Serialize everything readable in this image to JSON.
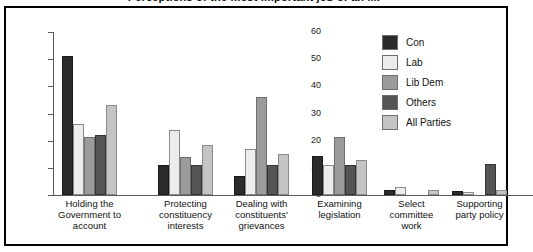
{
  "title": "Perceptions of the most important job of an MP",
  "legend": {
    "position": "top-right",
    "entries": [
      {
        "label": "Con",
        "color": "#2b2b2b",
        "icon": "legend-swatch"
      },
      {
        "label": "Lab",
        "color": "#ececec",
        "icon": "legend-swatch"
      },
      {
        "label": "Lib Dem",
        "color": "#9b9b9b",
        "icon": "legend-swatch"
      },
      {
        "label": "Others",
        "color": "#555555",
        "icon": "legend-swatch"
      },
      {
        "label": "All Parties",
        "color": "#c4c4c4",
        "icon": "legend-swatch"
      }
    ]
  },
  "axis": {
    "y_ticks": [
      "0",
      "10",
      "20",
      "30",
      "40",
      "50",
      "60"
    ],
    "y_min": 0,
    "y_max": 60
  },
  "chart_data": {
    "type": "bar",
    "title": "Perceptions of the most important job of an MP",
    "xlabel": "",
    "ylabel": "",
    "ylim": [
      0,
      60
    ],
    "grid": false,
    "legend_position": "top-right",
    "categories": [
      "Holding the Government to account",
      "Protecting constituency interests",
      "Dealing with constituents' grievances",
      "Examining legislation",
      "Select committee work",
      "Supporting party policy"
    ],
    "category_lines": [
      [
        "Holding the",
        "Government to",
        "account"
      ],
      [
        "Protecting",
        "constituency",
        "interests"
      ],
      [
        "Dealing with",
        "constituents'",
        "grievances"
      ],
      [
        "Examining",
        "legislation"
      ],
      [
        "Select",
        "committee",
        "work"
      ],
      [
        "Supporting",
        "party policy"
      ]
    ],
    "series": [
      {
        "name": "Con",
        "color": "#2b2b2b",
        "values": [
          51,
          11,
          7,
          14.5,
          2,
          1.5
        ]
      },
      {
        "name": "Lab",
        "color": "#ececec",
        "values": [
          26,
          24,
          17,
          11,
          3,
          1
        ]
      },
      {
        "name": "Lib Dem",
        "color": "#9b9b9b",
        "values": [
          21.5,
          14,
          36,
          21.5,
          0,
          0
        ]
      },
      {
        "name": "Others",
        "color": "#555555",
        "values": [
          22,
          11,
          11,
          11,
          0,
          11.5
        ]
      },
      {
        "name": "All Parties",
        "color": "#c4c4c4",
        "values": [
          33,
          18.5,
          15,
          13,
          2,
          2
        ]
      }
    ]
  }
}
